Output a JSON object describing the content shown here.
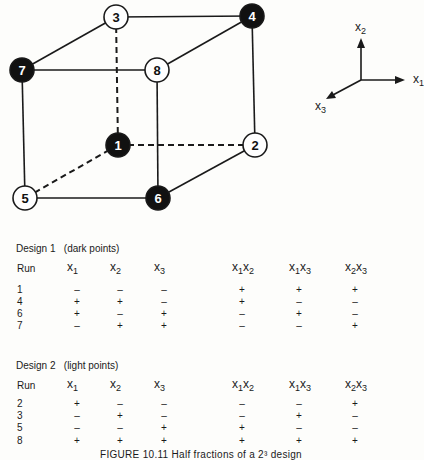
{
  "figure": {
    "nodes": [
      {
        "id": "1",
        "x": 118,
        "y": 145,
        "fill": "dark"
      },
      {
        "id": "2",
        "x": 255,
        "y": 145,
        "fill": "light"
      },
      {
        "id": "3",
        "x": 116,
        "y": 17,
        "fill": "light"
      },
      {
        "id": "4",
        "x": 252,
        "y": 16,
        "fill": "dark"
      },
      {
        "id": "5",
        "x": 25,
        "y": 198,
        "fill": "light"
      },
      {
        "id": "6",
        "x": 158,
        "y": 198,
        "fill": "dark"
      },
      {
        "id": "7",
        "x": 22,
        "y": 70,
        "fill": "dark"
      },
      {
        "id": "8",
        "x": 157,
        "y": 70,
        "fill": "light"
      }
    ],
    "edges": [
      {
        "from": "3",
        "to": "4",
        "style": "solid"
      },
      {
        "from": "3",
        "to": "7",
        "style": "solid"
      },
      {
        "from": "7",
        "to": "8",
        "style": "solid"
      },
      {
        "from": "8",
        "to": "4",
        "style": "solid"
      },
      {
        "from": "4",
        "to": "2",
        "style": "solid"
      },
      {
        "from": "7",
        "to": "5",
        "style": "solid"
      },
      {
        "from": "8",
        "to": "6",
        "style": "solid"
      },
      {
        "from": "5",
        "to": "6",
        "style": "solid"
      },
      {
        "from": "6",
        "to": "2",
        "style": "solid"
      },
      {
        "from": "3",
        "to": "1",
        "style": "dashed"
      },
      {
        "from": "1",
        "to": "2",
        "style": "dashed"
      },
      {
        "from": "1",
        "to": "5",
        "style": "dashed"
      }
    ],
    "axes": {
      "x1": "x",
      "x1_sub": "1",
      "x2": "x",
      "x2_sub": "2",
      "x3": "x",
      "x3_sub": "3"
    },
    "colors": {
      "dark": "#111111",
      "light": "#ffffff",
      "line": "#1a1a1a"
    }
  },
  "design1": {
    "title": "Design 1",
    "subtitle": "(dark points)",
    "headers": [
      "Run",
      "x1",
      "x2",
      "x3",
      "x1x2",
      "x1x3",
      "x2x3"
    ],
    "rows": [
      [
        "1",
        "–",
        "–",
        "–",
        "+",
        "+",
        "+"
      ],
      [
        "4",
        "+",
        "+",
        "–",
        "+",
        "–",
        "–"
      ],
      [
        "6",
        "+",
        "–",
        "+",
        "–",
        "+",
        "–"
      ],
      [
        "7",
        "–",
        "+",
        "+",
        "–",
        "–",
        "+"
      ]
    ]
  },
  "design2": {
    "title": "Design 2",
    "subtitle": "(light points)",
    "headers": [
      "Run",
      "x1",
      "x2",
      "x3",
      "x1x2",
      "x1x3",
      "x2x3"
    ],
    "rows": [
      [
        "2",
        "+",
        "–",
        "–",
        "–",
        "–",
        "+"
      ],
      [
        "3",
        "–",
        "+",
        "–",
        "–",
        "+",
        "–"
      ],
      [
        "5",
        "–",
        "–",
        "+",
        "+",
        "–",
        "–"
      ],
      [
        "8",
        "+",
        "+",
        "+",
        "+",
        "+",
        "+"
      ]
    ]
  },
  "caption": "FIGURE 10.11    Half fractions of a 2³ design"
}
